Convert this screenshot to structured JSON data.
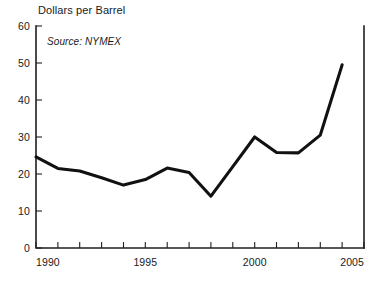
{
  "chart_data": {
    "type": "line",
    "title": "Dollars per Barrel",
    "source_note": "Source: NYMEX",
    "xlabel": "",
    "ylabel": "",
    "xlim": [
      1990,
      2005
    ],
    "ylim": [
      0,
      60
    ],
    "grid": false,
    "legend": "none",
    "line_color": "#111111",
    "axis_color": "#231f20",
    "x_tick_labels": [
      "1990",
      "1995",
      "2000",
      "2005"
    ],
    "x_tick_values": [
      1990,
      1995,
      2000,
      2005
    ],
    "x_minor_ticks": [
      1991,
      1992,
      1993,
      1994,
      1996,
      1997,
      1998,
      1999,
      2001,
      2002,
      2003,
      2004
    ],
    "y_tick_labels": [
      "0",
      "10",
      "20",
      "30",
      "40",
      "50",
      "60"
    ],
    "y_tick_values": [
      0,
      10,
      20,
      30,
      40,
      50,
      60
    ],
    "series": [
      {
        "name": "Crude oil price",
        "x": [
          1990,
          1991,
          1992,
          1993,
          1994,
          1995,
          1996,
          1997,
          1998,
          1999,
          2000,
          2001,
          2002,
          2003,
          2004
        ],
        "values": [
          24.6,
          21.5,
          20.8,
          19.0,
          17.0,
          18.5,
          21.6,
          20.4,
          14.0,
          22.0,
          30.0,
          25.8,
          25.7,
          30.5,
          49.5
        ]
      }
    ]
  }
}
